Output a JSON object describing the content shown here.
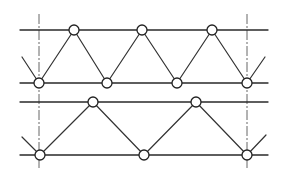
{
  "diagram": {
    "title": "",
    "colors": {
      "line": "#2a2a2a",
      "node_fill": "#ffffff",
      "background": "#ffffff"
    },
    "node_radius": 5,
    "axes": [
      {
        "id": "axis-left",
        "x": 39,
        "y1": 14,
        "y2": 170
      },
      {
        "id": "axis-right",
        "x": 247,
        "y1": 14,
        "y2": 170
      }
    ],
    "trusses": [
      {
        "id": "truss-top",
        "top_chord": {
          "x1": 20,
          "x2": 268,
          "y": 30
        },
        "bottom_chord": {
          "x1": 20,
          "x2": 268,
          "y": 83
        },
        "top_nodes": [
          {
            "x": 74,
            "y": 30
          },
          {
            "x": 142,
            "y": 30
          },
          {
            "x": 212,
            "y": 30
          }
        ],
        "bottom_nodes": [
          {
            "x": 39,
            "y": 83
          },
          {
            "x": 107,
            "y": 83
          },
          {
            "x": 177,
            "y": 83
          },
          {
            "x": 247,
            "y": 83
          }
        ],
        "members": [
          [
            39,
            83,
            74,
            30
          ],
          [
            74,
            30,
            107,
            83
          ],
          [
            107,
            83,
            142,
            30
          ],
          [
            142,
            30,
            177,
            83
          ],
          [
            177,
            83,
            212,
            30
          ],
          [
            212,
            30,
            247,
            83
          ]
        ],
        "stubs": [
          [
            22,
            57,
            39,
            83
          ],
          [
            247,
            83,
            265,
            57
          ]
        ]
      },
      {
        "id": "truss-bottom",
        "top_chord": {
          "x1": 20,
          "x2": 268,
          "y": 102
        },
        "bottom_chord": {
          "x1": 20,
          "x2": 268,
          "y": 155
        },
        "top_nodes": [
          {
            "x": 93,
            "y": 102
          },
          {
            "x": 196,
            "y": 102
          }
        ],
        "bottom_nodes": [
          {
            "x": 40,
            "y": 155
          },
          {
            "x": 144,
            "y": 155
          },
          {
            "x": 247,
            "y": 155
          }
        ],
        "members": [
          [
            40,
            155,
            93,
            102
          ],
          [
            93,
            102,
            144,
            155
          ],
          [
            144,
            155,
            196,
            102
          ],
          [
            196,
            102,
            247,
            155
          ]
        ],
        "stubs": [
          [
            22,
            137,
            40,
            155
          ],
          [
            247,
            155,
            266,
            135
          ]
        ]
      }
    ]
  }
}
